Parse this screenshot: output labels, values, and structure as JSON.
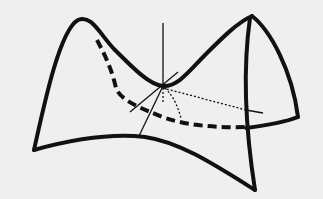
{
  "figure": {
    "background_color": "#efefef",
    "stroke_color": "#111111",
    "labels": []
  }
}
